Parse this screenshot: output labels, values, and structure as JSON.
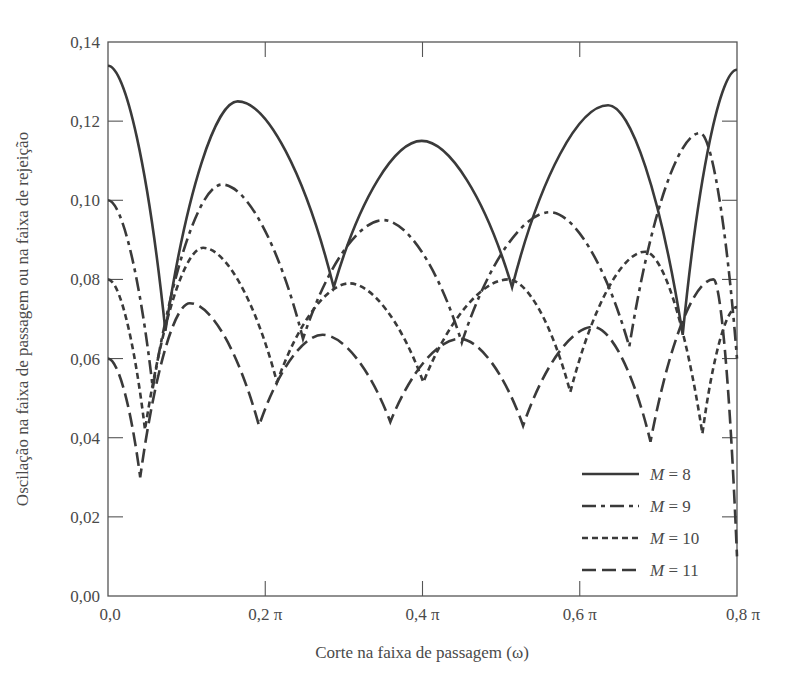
{
  "chart_data": {
    "type": "line",
    "title": "",
    "xlabel": "Corte na faixa de passagem (ω)",
    "ylabel": "Oscilação na faixa de passagem ou na faixa de rejeição",
    "xlim": [
      0,
      0.8
    ],
    "ylim": [
      0,
      0.14
    ],
    "x_unit": "π",
    "grid": false,
    "legend_position": "lower right",
    "x_ticks": [
      0,
      0.2,
      0.4,
      0.6,
      0.8
    ],
    "x_tick_labels": [
      "0,0",
      "0,2 π",
      "0,4 π",
      "0,6 π",
      "0,8 π"
    ],
    "y_ticks": [
      0,
      0.02,
      0.04,
      0.06,
      0.08,
      0.1,
      0.12,
      0.14
    ],
    "y_tick_labels": [
      "0,00",
      "0,02",
      "0,04",
      "0,06",
      "0,08",
      "0,10",
      "0,12",
      "0,14"
    ],
    "series": [
      {
        "name": "M = 8",
        "style": "solid",
        "x": [
          0,
          0.073,
          0.165,
          0.287,
          0.399,
          0.514,
          0.636,
          0.731,
          0.8
        ],
        "y": [
          0.134,
          0.067,
          0.125,
          0.078,
          0.115,
          0.078,
          0.124,
          0.066,
          0.133
        ]
      },
      {
        "name": "M = 9",
        "style": "dashdot",
        "x": [
          0,
          0.057,
          0.145,
          0.248,
          0.35,
          0.45,
          0.562,
          0.663,
          0.753,
          0.8
        ],
        "y": [
          0.1,
          0.0525,
          0.104,
          0.065,
          0.095,
          0.064,
          0.097,
          0.063,
          0.117,
          0.06
        ]
      },
      {
        "name": "M = 10",
        "style": "shortdash",
        "x": [
          0,
          0.047,
          0.121,
          0.215,
          0.307,
          0.401,
          0.509,
          0.588,
          0.683,
          0.756,
          0.8
        ],
        "y": [
          0.08,
          0.042,
          0.088,
          0.054,
          0.079,
          0.054,
          0.08,
          0.0515,
          0.087,
          0.041,
          0.073
        ]
      },
      {
        "name": "M = 11",
        "style": "longdash",
        "x": [
          0,
          0.041,
          0.104,
          0.192,
          0.273,
          0.359,
          0.447,
          0.528,
          0.617,
          0.69,
          0.77,
          0.8
        ],
        "y": [
          0.06,
          0.03,
          0.074,
          0.043,
          0.066,
          0.044,
          0.065,
          0.043,
          0.068,
          0.039,
          0.08,
          0.01
        ]
      }
    ]
  },
  "legend": {
    "items": [
      {
        "var": "M",
        "rest": " = 8"
      },
      {
        "var": "M",
        "rest": " = 9"
      },
      {
        "var": "M",
        "rest": " = 10"
      },
      {
        "var": "M",
        "rest": " = 11"
      }
    ]
  },
  "colors": {
    "line": "#3a3a3a",
    "axis": "#555555",
    "text": "#4a4a4a"
  }
}
